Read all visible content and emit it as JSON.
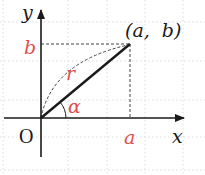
{
  "diagram": {
    "type": "coordinate-plane-polar",
    "axes": {
      "x_label": "x",
      "y_label": "y",
      "origin_label": "O"
    },
    "point": {
      "label": "(a,  b)",
      "x_label": "a",
      "y_label": "b"
    },
    "radius_label": "r",
    "angle_label": "α",
    "colors": {
      "axis": "#1a1a1a",
      "segment": "#1a1a1a",
      "accent_labels": "#e05050",
      "grid": "#d8d8d8",
      "dashed": "#444444"
    }
  }
}
